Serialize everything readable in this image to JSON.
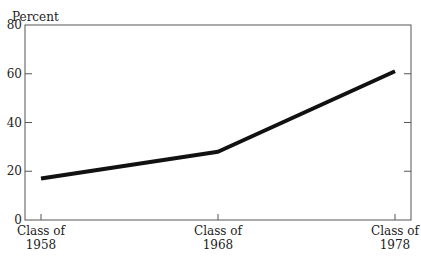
{
  "chart_data": {
    "type": "line",
    "title": "",
    "ylabel": "Percent",
    "xlabel": "",
    "ylim": [
      0,
      80
    ],
    "yticks": [
      0,
      20,
      40,
      60,
      80
    ],
    "ytick_labels": [
      "0",
      "20",
      "40",
      "60",
      "80"
    ],
    "categories": [
      "Class of 1958",
      "Class of 1968",
      "Class of 1978"
    ],
    "category_lines": [
      [
        "Class of",
        "1958"
      ],
      [
        "Class of",
        "1968"
      ],
      [
        "Class of",
        "1978"
      ]
    ],
    "series": [
      {
        "name": "Percent",
        "values": [
          17,
          28,
          61
        ]
      }
    ],
    "grid": false,
    "legend": "none",
    "line_color": "#111111"
  }
}
